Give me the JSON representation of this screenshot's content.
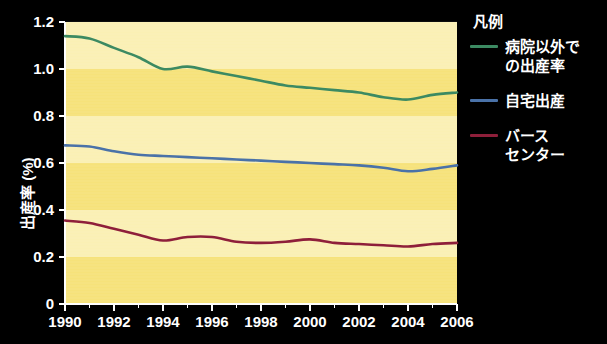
{
  "chart_data": {
    "type": "line",
    "title": "",
    "xlabel": "",
    "ylabel": "出産率 (%)",
    "xlim": [
      1990,
      2006
    ],
    "ylim": [
      0,
      1.2
    ],
    "grid": false,
    "legend_position": "right",
    "background_bands": true,
    "x": [
      1990,
      1991,
      1992,
      1993,
      1994,
      1995,
      1996,
      1997,
      1998,
      1999,
      2000,
      2001,
      2002,
      2003,
      2004,
      2005,
      2006
    ],
    "xticks": [
      "1990",
      "1992",
      "1994",
      "1996",
      "1998",
      "2000",
      "2002",
      "2004",
      "2006"
    ],
    "yticks": [
      "0",
      "0.2",
      "0.4",
      "0.6",
      "0.8",
      "1.0",
      "1.2"
    ],
    "series": [
      {
        "name": "病院以外での出産率",
        "color": "#3c8a62",
        "values": [
          1.14,
          1.13,
          1.09,
          1.05,
          1.0,
          1.01,
          0.99,
          0.97,
          0.95,
          0.93,
          0.92,
          0.91,
          0.9,
          0.88,
          0.87,
          0.89,
          0.9
        ]
      },
      {
        "name": "自宅出産",
        "color": "#4a72a8",
        "values": [
          0.675,
          0.67,
          0.65,
          0.635,
          0.63,
          0.625,
          0.62,
          0.615,
          0.61,
          0.605,
          0.6,
          0.595,
          0.59,
          0.58,
          0.565,
          0.575,
          0.59
        ]
      },
      {
        "name": "バースセンター",
        "color": "#8e1f3a",
        "values": [
          0.355,
          0.345,
          0.32,
          0.295,
          0.27,
          0.285,
          0.285,
          0.265,
          0.26,
          0.265,
          0.275,
          0.26,
          0.255,
          0.25,
          0.245,
          0.255,
          0.26
        ]
      }
    ]
  },
  "legend": {
    "title": "凡例",
    "items": [
      {
        "label": "病院以外で\nの出産率",
        "color": "#3c8a62"
      },
      {
        "label": "自宅出産",
        "color": "#4a72a8"
      },
      {
        "label": "バース\nセンター",
        "color": "#8e1f3a"
      }
    ]
  },
  "axes": {
    "y_title": "出産率 (%)"
  },
  "colors": {
    "background": "#000000",
    "plot_band_light": "#faf0b4",
    "plot_band_dark": "#f6e27a",
    "axis": "#ffffff",
    "text": "#ffffff"
  }
}
